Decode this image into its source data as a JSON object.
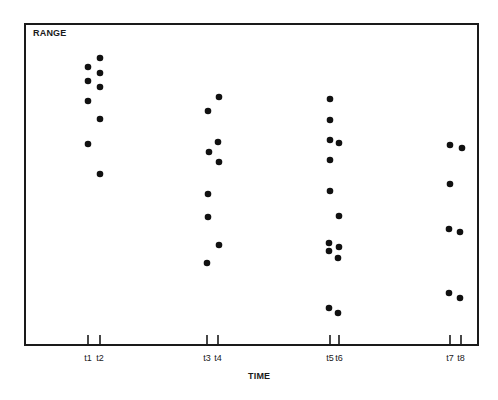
{
  "chart_data": {
    "type": "scatter",
    "title": "",
    "xlabel": "TIME",
    "ylabel": "RANGE",
    "grid": false,
    "legend": null,
    "x_ticks": [
      "t1",
      "t2",
      "t3",
      "t4",
      "t5",
      "t6",
      "t7",
      "t8"
    ],
    "tick_pixel_x": {
      "t1": 88,
      "t2": 100,
      "t3": 207,
      "t4": 218,
      "t5": 330,
      "t6": 339,
      "t7": 450,
      "t8": 461
    },
    "y_axis_values_shown": false,
    "note": "y values are relative RANGE positions (0 = bottom axis, 100 = top of frame); no numeric ticks shown",
    "series": [
      {
        "name": "t1",
        "x": "t1",
        "values": [
          86,
          82,
          76,
          62
        ]
      },
      {
        "name": "t2",
        "x": "t2",
        "values": [
          89,
          84,
          80,
          70,
          53
        ]
      },
      {
        "name": "t3",
        "x": "t3",
        "values": [
          73,
          60,
          47,
          39,
          25
        ]
      },
      {
        "name": "t4",
        "x": "t4",
        "values": [
          77,
          63,
          57,
          31
        ]
      },
      {
        "name": "t5",
        "x": "t5",
        "values": [
          77,
          70,
          64,
          58,
          48,
          32,
          29,
          11
        ]
      },
      {
        "name": "t6",
        "x": "t6",
        "values": [
          63,
          40,
          30,
          27,
          10
        ]
      },
      {
        "name": "t7",
        "x": "t7",
        "values": [
          62,
          50,
          36,
          16
        ]
      },
      {
        "name": "t8",
        "x": "t8",
        "values": [
          61,
          35,
          14
        ]
      }
    ]
  },
  "labels": {
    "ylabel": "RANGE",
    "xlabel": "TIME"
  },
  "points_px": [
    {
      "t": "t1",
      "x": 88,
      "y": 67
    },
    {
      "t": "t1",
      "x": 88,
      "y": 81
    },
    {
      "t": "t1",
      "x": 88,
      "y": 101
    },
    {
      "t": "t1",
      "x": 88,
      "y": 144
    },
    {
      "t": "t2",
      "x": 100,
      "y": 58
    },
    {
      "t": "t2",
      "x": 100,
      "y": 73
    },
    {
      "t": "t2",
      "x": 100,
      "y": 87
    },
    {
      "t": "t2",
      "x": 100,
      "y": 119
    },
    {
      "t": "t2",
      "x": 100,
      "y": 174
    },
    {
      "t": "t3",
      "x": 208,
      "y": 111
    },
    {
      "t": "t3",
      "x": 209,
      "y": 152
    },
    {
      "t": "t3",
      "x": 208,
      "y": 194
    },
    {
      "t": "t3",
      "x": 208,
      "y": 217
    },
    {
      "t": "t3",
      "x": 207,
      "y": 263
    },
    {
      "t": "t4",
      "x": 219,
      "y": 97
    },
    {
      "t": "t4",
      "x": 218,
      "y": 142
    },
    {
      "t": "t4",
      "x": 219,
      "y": 162
    },
    {
      "t": "t4",
      "x": 219,
      "y": 245
    },
    {
      "t": "t5",
      "x": 330,
      "y": 99
    },
    {
      "t": "t5",
      "x": 330,
      "y": 120
    },
    {
      "t": "t5",
      "x": 330,
      "y": 140
    },
    {
      "t": "t5",
      "x": 330,
      "y": 160
    },
    {
      "t": "t5",
      "x": 330,
      "y": 191
    },
    {
      "t": "t5",
      "x": 329,
      "y": 243
    },
    {
      "t": "t5",
      "x": 329,
      "y": 251
    },
    {
      "t": "t5",
      "x": 329,
      "y": 308
    },
    {
      "t": "t6",
      "x": 339,
      "y": 143
    },
    {
      "t": "t6",
      "x": 339,
      "y": 216
    },
    {
      "t": "t6",
      "x": 339,
      "y": 247
    },
    {
      "t": "t6",
      "x": 338,
      "y": 258
    },
    {
      "t": "t6",
      "x": 338,
      "y": 313
    },
    {
      "t": "t7",
      "x": 450,
      "y": 145
    },
    {
      "t": "t7",
      "x": 450,
      "y": 184
    },
    {
      "t": "t7",
      "x": 449,
      "y": 229
    },
    {
      "t": "t7",
      "x": 449,
      "y": 293
    },
    {
      "t": "t8",
      "x": 462,
      "y": 148
    },
    {
      "t": "t8",
      "x": 460,
      "y": 232
    },
    {
      "t": "t8",
      "x": 460,
      "y": 298
    }
  ],
  "colors": {
    "axis": "#1a1a1a",
    "point": "#111111",
    "background": "#ffffff"
  }
}
